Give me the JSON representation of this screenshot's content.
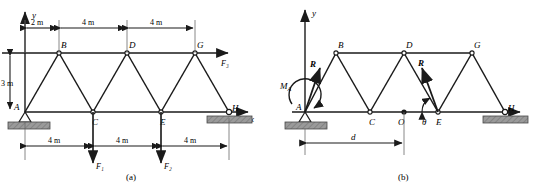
{
  "figure": {
    "caption_a": "(a)",
    "caption_b": "(b)",
    "axis_labels": {
      "x": "x",
      "y": "y"
    }
  },
  "panel_a": {
    "caption": "(a)",
    "nodes": [
      {
        "id": "A",
        "label": "A",
        "x": 0,
        "y": 0
      },
      {
        "id": "B",
        "label": "B",
        "x": 2,
        "y": 3
      },
      {
        "id": "C",
        "label": "C",
        "x": 4,
        "y": 0
      },
      {
        "id": "D",
        "label": "D",
        "x": 6,
        "y": 3
      },
      {
        "id": "E",
        "label": "E",
        "x": 8,
        "y": 0
      },
      {
        "id": "G",
        "label": "G",
        "x": 10,
        "y": 3
      },
      {
        "id": "H",
        "label": "H",
        "x": 12,
        "y": 0
      }
    ],
    "top_dimensions": [
      {
        "label": "2 m",
        "value": 2,
        "unit": "m"
      },
      {
        "label": "4 m",
        "value": 4,
        "unit": "m"
      },
      {
        "label": "4 m",
        "value": 4,
        "unit": "m"
      }
    ],
    "bottom_dimensions": [
      {
        "label": "4 m",
        "value": 4,
        "unit": "m"
      },
      {
        "label": "4 m",
        "value": 4,
        "unit": "m"
      },
      {
        "label": "4 m",
        "value": 4,
        "unit": "m"
      }
    ],
    "vertical_dimension": {
      "label": "3 m",
      "value": 3,
      "unit": "m"
    },
    "loads": [
      {
        "label": "F₁",
        "at_node": "C",
        "direction": "down"
      },
      {
        "label": "F₂",
        "at_node": "E",
        "direction": "down"
      },
      {
        "label": "F₃",
        "at_node": "G",
        "direction": "right"
      }
    ],
    "supports": [
      {
        "at_node": "A",
        "type": "pin"
      },
      {
        "at_node": "H",
        "type": "roller"
      }
    ]
  },
  "panel_b": {
    "caption": "(b)",
    "nodes": [
      {
        "id": "A",
        "label": "A",
        "x": 0,
        "y": 0
      },
      {
        "id": "B",
        "label": "B",
        "x": 2,
        "y": 3
      },
      {
        "id": "C",
        "label": "C",
        "x": 4,
        "y": 0
      },
      {
        "id": "O",
        "label": "O",
        "x": 6,
        "y": 0
      },
      {
        "id": "D",
        "label": "D",
        "x": 6,
        "y": 3
      },
      {
        "id": "E",
        "label": "E",
        "x": 8,
        "y": 0
      },
      {
        "id": "G",
        "label": "G",
        "x": 10,
        "y": 3
      },
      {
        "id": "H",
        "label": "H",
        "x": 12,
        "y": 0
      }
    ],
    "resultants": [
      {
        "label": "R",
        "at_node": "A",
        "kind": "force-vector"
      },
      {
        "label": "R",
        "at_node": "E",
        "kind": "force-vector"
      }
    ],
    "moment": {
      "label": "M",
      "subscript": "A",
      "display": "M",
      "at_node": "A"
    },
    "angle": {
      "label": "θ",
      "at_node": "E"
    },
    "distance": {
      "label": "d",
      "from": "A",
      "to": "O"
    },
    "supports": [
      {
        "at_node": "A",
        "type": "pin"
      },
      {
        "at_node": "H",
        "type": "roller"
      }
    ]
  },
  "colors": {
    "line": "#1a1a1a",
    "support_fill": "#9a9a9a",
    "support_stroke": "#4a4a4a",
    "background": "#ffffff"
  }
}
